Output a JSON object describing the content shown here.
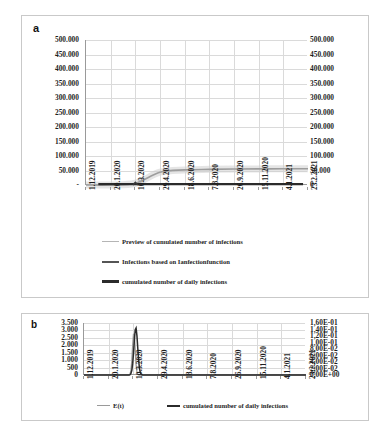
{
  "figure": {
    "panels": [
      {
        "id": "a",
        "letter": "a"
      },
      {
        "id": "b",
        "letter": "b"
      }
    ]
  },
  "chart_data": [
    {
      "panel": "a",
      "type": "line",
      "title": "",
      "xlabel": "",
      "ylabel": "",
      "grid": true,
      "legend_position": "bottom",
      "x_ticklabels": [
        "1.12.2019",
        "20.1.2020",
        "10.3.2020",
        "29.4.2020",
        "18.6.2020",
        "7.8.2020",
        "26.9.2020",
        "15.11.2020",
        "4.1.2021",
        "23.2.2021"
      ],
      "y_left_ticklabels": [
        "500.000",
        "450.000",
        "400.000",
        "350.000",
        "300.000",
        "250.000",
        "200.000",
        "150.000",
        "100.000",
        "50.000",
        "-"
      ],
      "y_right_ticklabels": [
        "500.000",
        "450.000",
        "400.000",
        "350.000",
        "300.000",
        "250.000",
        "200.000",
        "150.000",
        "100.000",
        "50.000",
        "0"
      ],
      "ylim": [
        0,
        500000
      ],
      "y_right_lim": [
        0,
        500000
      ],
      "series": [
        {
          "name": "Preview of cumulated number of infections",
          "style": "thin-grey",
          "x": [
            "1.12.2019",
            "20.1.2020",
            "10.3.2020",
            "29.4.2020",
            "18.6.2020",
            "7.8.2020",
            "26.9.2020",
            "15.11.2020",
            "4.1.2021",
            "23.2.2021"
          ],
          "values": [
            0,
            0,
            6000,
            44000,
            52000,
            54000,
            55000,
            55500,
            56000,
            56000
          ]
        },
        {
          "name": "Infections based on Ianfectionfunction",
          "style": "medium-dark",
          "x": [
            "1.12.2019",
            "20.1.2020",
            "10.3.2020",
            "29.4.2020",
            "18.6.2020",
            "7.8.2020",
            "26.9.2020",
            "15.11.2020",
            "4.1.2021",
            "23.2.2021"
          ],
          "values": [
            0,
            0,
            9000,
            0,
            0,
            0,
            0,
            0,
            0,
            0
          ]
        },
        {
          "name": "cumulated number of daily infections",
          "style": "thick-black",
          "x": [
            "1.12.2019",
            "20.1.2020",
            "10.3.2020",
            "29.4.2020",
            "18.6.2020",
            "7.8.2020",
            "26.9.2020",
            "15.11.2020",
            "4.1.2021",
            "23.2.2021"
          ],
          "values": [
            0,
            0,
            0,
            0,
            0,
            0,
            0,
            0,
            0,
            0
          ]
        }
      ]
    },
    {
      "panel": "b",
      "type": "line",
      "title": "",
      "xlabel": "",
      "ylabel": "",
      "grid": true,
      "legend_position": "bottom",
      "x_ticklabels": [
        "1.12.2019",
        "20.1.2020",
        "10.3.2020",
        "29.4.2020",
        "18.6.2020",
        "7.8.2020",
        "26.9.2020",
        "15.11.2020",
        "4.1.2021",
        "23.2.2021"
      ],
      "y_left_ticklabels": [
        "3.500",
        "3.000",
        "2.500",
        "2.000",
        "1.500",
        "1.000",
        "500",
        "0"
      ],
      "y_right_ticklabels": [
        "1,60E-01",
        "1,40E-01",
        "1,20E-01",
        "1,00E-01",
        "8,00E-02",
        "6,00E-02",
        "4,00E-02",
        "2,00E-02",
        "0,00E+00"
      ],
      "ylim": [
        0,
        3500
      ],
      "y_right_lim": [
        0,
        0.16
      ],
      "series": [
        {
          "name": "E(t)",
          "style": "thin-grey",
          "peak_x": "10.3.2020",
          "peak_value": 2850,
          "values": [
            0,
            0,
            2850,
            0,
            0,
            0,
            0,
            0,
            0,
            0
          ]
        },
        {
          "name": "cumulated number of daily infections",
          "style": "thick-black",
          "peak_x": "10.3.2020",
          "peak_value": 3200,
          "values": [
            0,
            0,
            3200,
            0,
            0,
            0,
            0,
            0,
            0,
            0
          ]
        }
      ]
    }
  ],
  "legend_a": [
    {
      "label": "Preview of cumulated number of infections",
      "swatch": "thin"
    },
    {
      "label": "Infections based on Ianfectionfunction",
      "swatch": "mid"
    },
    {
      "label": "cumulated number of daily infections",
      "swatch": "thick"
    }
  ],
  "legend_b": [
    {
      "label": "E(t)",
      "swatch": "thin"
    },
    {
      "label": "cumulated number of daily infections",
      "swatch": "thick"
    }
  ],
  "colors": {
    "grid": "#dadada",
    "axis": "#9a9a9a",
    "series_light": "#b5b5b5",
    "series_dark": "#2b2b2b",
    "text": "#1f1f1f",
    "panel_border": "#c9c9c9"
  }
}
